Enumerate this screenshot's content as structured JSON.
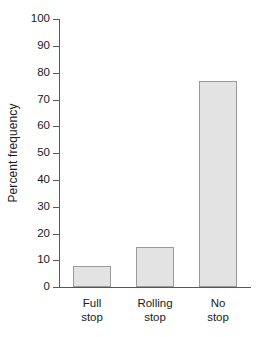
{
  "chart_data": {
    "type": "bar",
    "title": "",
    "subtitle": "",
    "xlabel": "",
    "ylabel": "Percent frequency",
    "categories": [
      "Full stop",
      "Rolling stop",
      "No stop"
    ],
    "category_lines": [
      [
        "Full",
        "stop"
      ],
      [
        "Rolling",
        "stop"
      ],
      [
        "No",
        "stop"
      ]
    ],
    "values": [
      8,
      15,
      77
    ],
    "ylim": [
      0,
      100
    ],
    "yticks": [
      0,
      10,
      20,
      30,
      40,
      50,
      60,
      70,
      80,
      90,
      100
    ],
    "ytick_labels": [
      "0",
      "10",
      "20",
      "30",
      "40",
      "50",
      "60",
      "70",
      "80",
      "90",
      "100"
    ],
    "grid": false,
    "legend": false,
    "legend_position": "none",
    "bar_fill_color": "#e3e3e3",
    "bar_edge_color": "#9a9a9a",
    "axis_color": "#595959",
    "text_color": "#1a1a1a",
    "background_color": "#ffffff"
  }
}
